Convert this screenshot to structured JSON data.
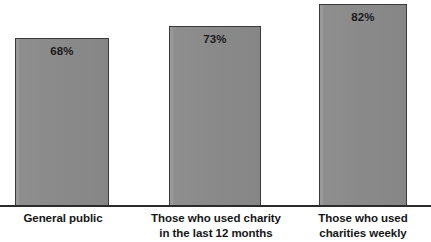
{
  "chart_data": {
    "type": "bar",
    "title": "",
    "subtitle": "",
    "xlabel": "",
    "ylabel": "",
    "ylim": [
      0,
      100
    ],
    "grid": false,
    "legend": false,
    "orientation": "vertical",
    "categories": [
      "General public",
      "Those who used charity in the last 12 months",
      "Those who used charities weekly"
    ],
    "values": [
      68,
      73,
      82
    ],
    "value_labels": [
      "68%",
      "73%",
      "82%"
    ],
    "bars": [
      {
        "category_lines": [
          "General public"
        ],
        "value": 68,
        "value_label": "68%",
        "bar_color": "#8a8a8a",
        "border_color": "#3a3a3a"
      },
      {
        "category_lines": [
          "Those who used charity",
          "in the last 12 months"
        ],
        "value": 73,
        "value_label": "73%",
        "bar_color": "#8a8a8a",
        "border_color": "#3a3a3a"
      },
      {
        "category_lines": [
          "Those who used",
          "charities weekly"
        ],
        "value": 82,
        "value_label": "82%",
        "bar_color": "#8a8a8a",
        "border_color": "#3a3a3a"
      }
    ],
    "colors": {
      "bar_fill": "#8a8a8a",
      "bar_fill_light": "#9a9a9a",
      "bar_border": "#3a3a3a",
      "axis_line": "#2b2b2b",
      "label_text": "#161616",
      "value_text": "#1a1a1a",
      "background": "#ffffff"
    }
  }
}
